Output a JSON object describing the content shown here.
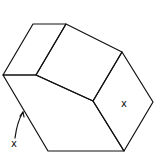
{
  "diagram": {
    "type": "line-drawing",
    "stroke_color": "#111111",
    "background": "#ffffff",
    "labels": [
      {
        "id": "face-label",
        "text": "x"
      },
      {
        "id": "edge-label",
        "text": "x"
      }
    ]
  }
}
